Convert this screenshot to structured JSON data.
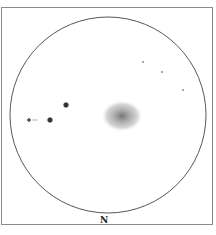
{
  "diagram": {
    "type": "telescope-field-sketch",
    "orientation_label": "N",
    "objects": [
      {
        "kind": "galaxy",
        "cx": 122,
        "cy": 116,
        "rx": 20,
        "ry": 15
      },
      {
        "kind": "star",
        "cx": 66,
        "cy": 105,
        "r": 2.6
      },
      {
        "kind": "star",
        "cx": 50,
        "cy": 120,
        "r": 2.6
      },
      {
        "kind": "star",
        "cx": 29,
        "cy": 120,
        "r": 1.8
      },
      {
        "kind": "star",
        "cx": 143,
        "cy": 62,
        "r": 0.9
      },
      {
        "kind": "star",
        "cx": 162,
        "cy": 72,
        "r": 0.9
      },
      {
        "kind": "star",
        "cx": 183,
        "cy": 90,
        "r": 0.9
      }
    ]
  }
}
